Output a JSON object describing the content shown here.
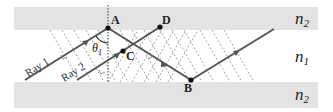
{
  "diagram": {
    "media": {
      "top": {
        "label": "n",
        "subscript": "2"
      },
      "middle": {
        "label": "n",
        "subscript": "1"
      },
      "bottom": {
        "label": "n",
        "subscript": "2"
      }
    },
    "points": {
      "A": "A",
      "B": "B",
      "C": "C",
      "D": "D"
    },
    "rays": {
      "ray1": "Ray 1",
      "ray2": "Ray 2"
    },
    "angle": {
      "symbol": "θ",
      "subscript": "1"
    },
    "colors": {
      "cladding": "#e3e3e3",
      "ray": "#555555",
      "wavefront": "#888888",
      "point": "#111111"
    }
  }
}
